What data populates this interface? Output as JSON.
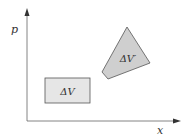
{
  "diagram": {
    "axes": {
      "x_label": "x",
      "y_label": "p"
    },
    "regions": [
      {
        "id": "original",
        "label": "ΔV",
        "shape": "rectangle",
        "fill": "#e6e6e6",
        "stroke": "#555555"
      },
      {
        "id": "transformed",
        "label": "ΔV′",
        "shape": "quadrilateral",
        "fill": "#cfcfcf",
        "stroke": "#555555"
      }
    ],
    "colors": {
      "axis": "#555555",
      "background": "#ffffff"
    }
  }
}
